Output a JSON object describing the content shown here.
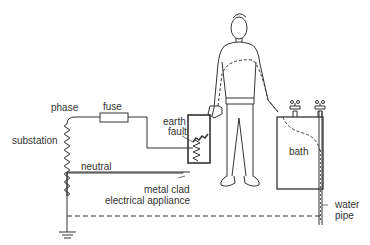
{
  "diagram": {
    "labels": {
      "phase": "phase",
      "fuse": "fuse",
      "substation": "substation",
      "neutral": "neutral",
      "earth_fault_line1": "earth",
      "earth_fault_line2": "fault",
      "appliance_line1": "metal clad",
      "appliance_line2": "electrical appliance",
      "bath": "bath",
      "water_pipe_line1": "water",
      "water_pipe_line2": "pipe"
    },
    "colors": {
      "line": "#333333",
      "background": "#ffffff"
    }
  }
}
